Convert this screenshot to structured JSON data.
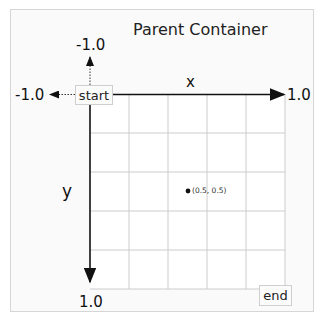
{
  "diagram": {
    "title": "Parent Container",
    "origin_label": "start",
    "end_label": "end",
    "x_axis": {
      "name": "x",
      "min_label": "-1.0",
      "max_label": "1.0"
    },
    "y_axis": {
      "name": "y",
      "min_label": "-1.0",
      "max_label": "1.0"
    },
    "grid": {
      "columns": 5,
      "rows": 5
    },
    "point": {
      "label": "(0.5, 0.5)",
      "x": 0.5,
      "y": 0.5
    },
    "colors": {
      "axis": "#111111",
      "grid": "#cccccc",
      "border": "#d6d6d6",
      "background": "#fafafa"
    }
  }
}
